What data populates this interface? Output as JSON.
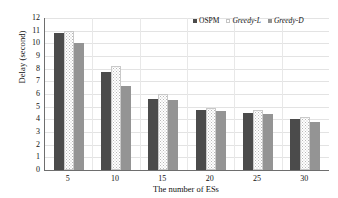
{
  "chart_data": {
    "type": "bar",
    "title": "",
    "xlabel": "The number of ESs",
    "ylabel": "Delay (second)",
    "categories": [
      "5",
      "10",
      "15",
      "20",
      "25",
      "30"
    ],
    "series": [
      {
        "name": "OSPM",
        "values": [
          10.8,
          7.7,
          5.6,
          4.75,
          4.5,
          4.05
        ],
        "color": "#4b4b4b",
        "italic": false
      },
      {
        "name": "Greedy-L",
        "values": [
          11.0,
          8.2,
          6.0,
          4.9,
          4.7,
          4.2
        ],
        "color": "#ffffff",
        "italic": true
      },
      {
        "name": "Greedy-D",
        "values": [
          10.0,
          6.6,
          5.55,
          4.65,
          4.4,
          3.8
        ],
        "color": "#949494",
        "italic": true
      }
    ],
    "ylim": [
      0,
      12
    ],
    "yticks": [
      "0",
      "1",
      "2",
      "3",
      "4",
      "5",
      "6",
      "7",
      "8",
      "9",
      "10",
      "11",
      "12"
    ],
    "grid": true,
    "legend_position": "top-right"
  }
}
